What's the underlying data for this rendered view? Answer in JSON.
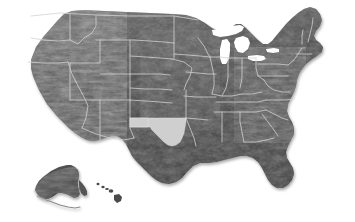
{
  "map": {
    "title": "United States shaded relief map",
    "projection": "albers-usa",
    "background_color": "#ffffff",
    "land_color": "#474747",
    "land_color_dark": "#2e2e2e",
    "land_color_light": "#6b6b6b",
    "border_color": "#d2d2d2",
    "water_color": "#ffffff",
    "highlight_color": "#cfcfcf",
    "highlight_border_color": "#e8e8e8",
    "shadow_color": "#b8b8b8",
    "highlighted_region": {
      "name": "Oklahoma",
      "abbr": "OK",
      "label": "Oklahoma",
      "fill": "#cfcfcf"
    },
    "insets": [
      {
        "name": "Alaska",
        "abbr": "AK",
        "label": "Alaska"
      },
      {
        "name": "Hawaii",
        "abbr": "HI",
        "label": "Hawaii"
      }
    ],
    "features": [
      {
        "name": "Great Lakes",
        "type": "water"
      },
      {
        "name": "Gulf of Mexico",
        "type": "water"
      },
      {
        "name": "Atlantic Ocean",
        "type": "water"
      },
      {
        "name": "Pacific Ocean",
        "type": "water"
      }
    ],
    "state_borders_visible": true,
    "relief_shading_visible": true
  }
}
